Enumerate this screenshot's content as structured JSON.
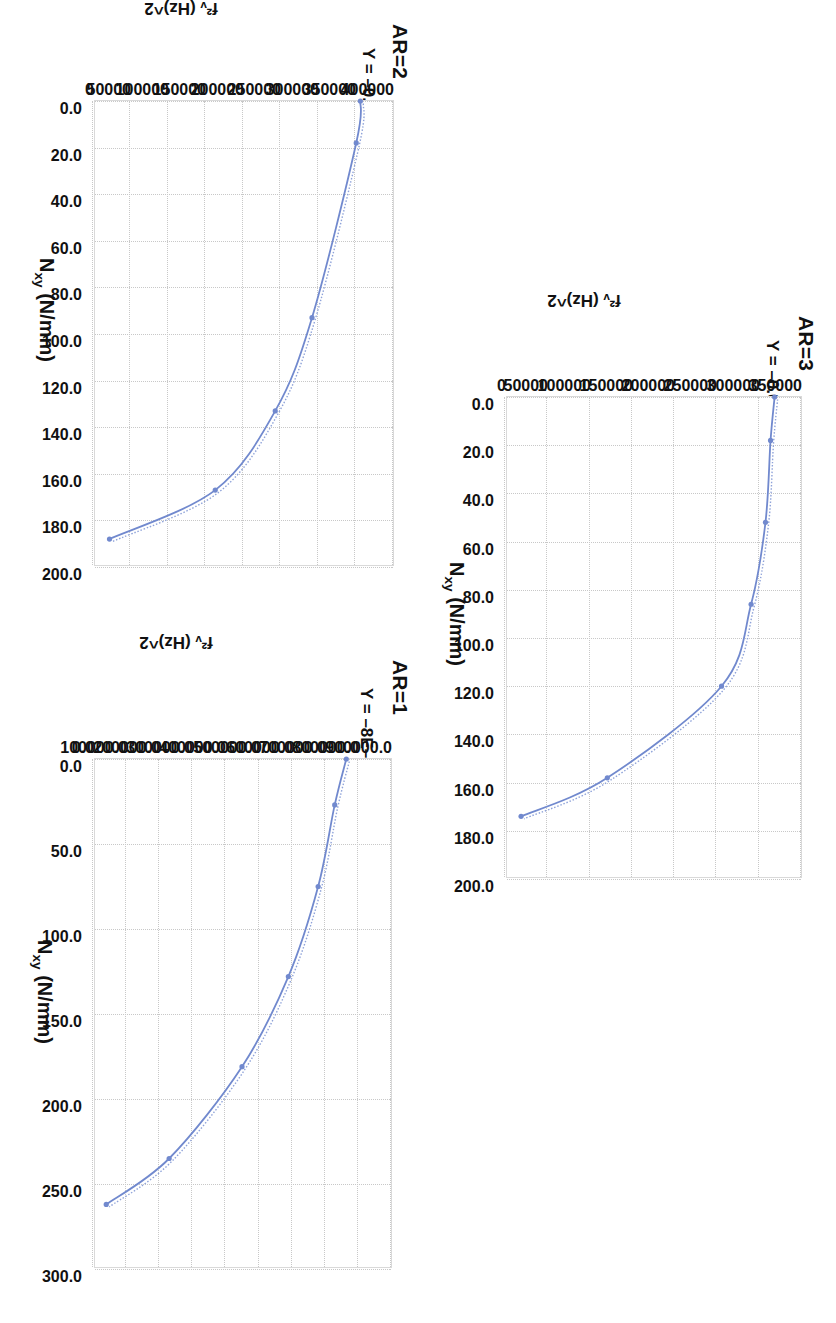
{
  "figure": {
    "background": "#ffffff",
    "series_color": "#7189CE",
    "trend_color": "#8fa3d9",
    "grid_color": "#c8c8c8"
  },
  "charts": [
    {
      "id": "ar1",
      "title": "AR=1",
      "equation_plain": "Y = -8E-05x4 + 0.0147x3 - 9.5849x2 + 52.863x + 764882",
      "equation_parts": {
        "lead": "Y = –8E–05x",
        "p1": "4",
        "t2": " + 0.0147x",
        "p2": "3",
        "t3": " – 9.5849x",
        "p3": "2",
        "tail": " + 52.863x + 764882"
      },
      "r2_label": "R",
      "r2_sup": "2",
      "r2_value": " = 1",
      "xlabel_main": "N",
      "xlabel_sub": "xy",
      "xlabel_unit": " (N/mm)",
      "ylabel": "f²ᵥ (Hz)^2",
      "xticks": [
        "0.0",
        "50.0",
        "100.0",
        "150.0",
        "200.0",
        "250.0",
        "300.0"
      ],
      "yticks": [
        "900000.0",
        "800000.0",
        "700000.0",
        "600000.0",
        "500000.0",
        "400000.0",
        "300000.0",
        "200000.0",
        "100000.0",
        "0.0"
      ]
    },
    {
      "id": "ar2",
      "title": "AR=2",
      "equation_plain": "Y = -0.0008x4 + 0.1856x3 - 18.612x2 + 317.61x + 356495",
      "equation_parts": {
        "lead": "Y = –0.0008x",
        "p1": "4",
        "t2": " + 0.1856x",
        "p2": "3",
        "t3": " – 18.612x",
        "p3": "2",
        "tail": " + 317.61x + 356495"
      },
      "r2_label": "R",
      "r2_sup": "2",
      "r2_value": " = 0.9999",
      "xlabel_main": "N",
      "xlabel_sub": "xy",
      "xlabel_unit": " (N/mm)",
      "ylabel": "f²ᵥ (Hz)^2",
      "xticks": [
        "0.0",
        "20.0",
        "40.0",
        "60.0",
        "80.0",
        "100.0",
        "120.0",
        "140.0",
        "160.0",
        "180.0",
        "200.0"
      ],
      "yticks": [
        "400000",
        "350000",
        "300000",
        "250000",
        "200000",
        "150000",
        "100000",
        "50000",
        "0"
      ]
    },
    {
      "id": "ar3",
      "title": "AR=3",
      "equation_plain": "Y = -0.0006x4 + 0.0452x3 - 0.5769x2 - 140.71x + 318794",
      "equation_parts": {
        "lead": "Y = –0.0006x",
        "p1": "4",
        "t2": " + 0.0452x",
        "p2": "3",
        "t3": " – 0.5769x",
        "p3": "2",
        "tail": " – 140.71x + 318794"
      },
      "r2_label": "R",
      "r2_sup": "2",
      "r2_value": " = 0.9998",
      "xlabel_main": "N",
      "xlabel_sub": "xy",
      "xlabel_unit": " (N/mm)",
      "ylabel": "f²ᵥ (Hz)^2",
      "xticks": [
        "0.0",
        "20.0",
        "40.0",
        "60.0",
        "80.0",
        "100.0",
        "120.0",
        "140.0",
        "160.0",
        "180.0",
        "200.0"
      ],
      "yticks": [
        "350000",
        "300000",
        "250000",
        "200000",
        "150000",
        "100000",
        "50000",
        "0"
      ]
    }
  ],
  "chart_data": [
    {
      "type": "line",
      "title": "AR=1",
      "xlabel": "Nxy (N/mm)",
      "ylabel": "f^2v (Hz)^2",
      "xlim": [
        0,
        300
      ],
      "ylim": [
        0,
        900000
      ],
      "xticks": [
        0,
        50,
        100,
        150,
        200,
        250,
        300
      ],
      "yticks": [
        0,
        100000,
        200000,
        300000,
        400000,
        500000,
        600000,
        700000,
        800000,
        900000
      ],
      "grid": true,
      "legend": "none",
      "annotations": [
        "Y = -8E-05x⁴ + 0.0147x³ - 9.5849x² + 52.863x + 764882",
        "R² = 1"
      ],
      "series": [
        {
          "name": "data",
          "x": [
            0,
            27,
            75,
            128,
            181,
            235,
            262
          ],
          "y": [
            765000,
            730000,
            680000,
            590000,
            450000,
            230000,
            40000
          ]
        }
      ]
    },
    {
      "type": "line",
      "title": "AR=2",
      "xlabel": "Nxy (N/mm)",
      "ylabel": "f^2v (Hz)^2",
      "xlim": [
        0,
        200
      ],
      "ylim": [
        0,
        400000
      ],
      "xticks": [
        0,
        20,
        40,
        60,
        80,
        100,
        120,
        140,
        160,
        180,
        200
      ],
      "yticks": [
        0,
        50000,
        100000,
        150000,
        200000,
        250000,
        300000,
        350000,
        400000
      ],
      "grid": true,
      "legend": "none",
      "annotations": [
        "Y = -0.0008x⁴ + 0.1856x³ - 18.612x² + 317.61x + 356495",
        "R² = 0.9999"
      ],
      "series": [
        {
          "name": "data",
          "x": [
            0,
            18,
            93,
            133,
            167,
            188
          ],
          "y": [
            356500,
            351000,
            292000,
            243000,
            163000,
            22000
          ]
        }
      ]
    },
    {
      "type": "line",
      "title": "AR=3",
      "xlabel": "Nxy (N/mm)",
      "ylabel": "f^2v (Hz)^2",
      "xlim": [
        0,
        200
      ],
      "ylim": [
        0,
        350000
      ],
      "xticks": [
        0,
        20,
        40,
        60,
        80,
        100,
        120,
        140,
        160,
        180,
        200
      ],
      "yticks": [
        0,
        50000,
        100000,
        150000,
        200000,
        250000,
        300000,
        350000
      ],
      "grid": true,
      "legend": "none",
      "annotations": [
        "Y = -0.0006x⁴ + 0.0452x³ - 0.5769x² - 140.71x + 318794",
        "R² = 0.9998"
      ],
      "series": [
        {
          "name": "data",
          "x": [
            0,
            18,
            52,
            86,
            120,
            158,
            174
          ],
          "y": [
            318800,
            314000,
            308000,
            291000,
            256000,
            121000,
            19000
          ]
        }
      ]
    }
  ]
}
